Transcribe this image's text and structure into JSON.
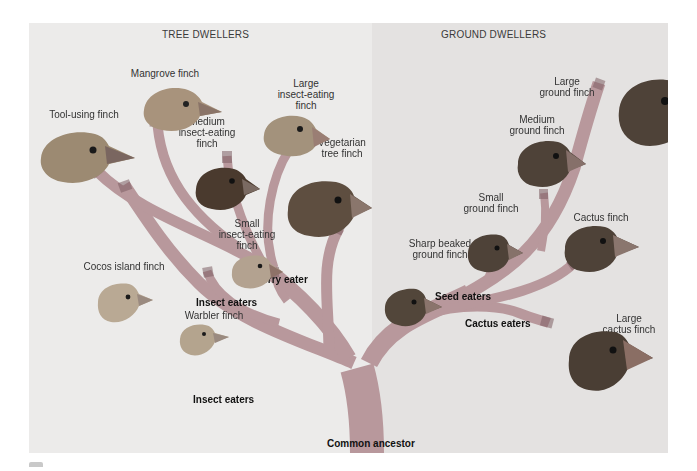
{
  "sections": {
    "left_title": "TREE DWELLERS",
    "right_title": "GROUND DWELLERS"
  },
  "colors": {
    "panel_left": "#ecebea",
    "panel_right": "#e4e2e1",
    "branch": "#b8989c",
    "branch_dark": "#8e6f74",
    "bird_dark": "#5b4a3e",
    "bird_light": "#b8a690",
    "beak": "#c8a89a"
  },
  "species": [
    {
      "id": "mangrove",
      "label": "Mangrove finch"
    },
    {
      "id": "tool_using",
      "label": "Tool-using finch"
    },
    {
      "id": "medium_insect",
      "label": "Medium\ninsect-eating\nfinch"
    },
    {
      "id": "large_insect",
      "label": "Large\ninsect-eating\nfinch"
    },
    {
      "id": "vegetarian",
      "label": "Vegetarian\ntree finch"
    },
    {
      "id": "small_insect",
      "label": "Small\ninsect-eating\nfinch"
    },
    {
      "id": "cocos",
      "label": "Cocos island finch"
    },
    {
      "id": "warbler",
      "label": "Warbler finch"
    },
    {
      "id": "large_ground",
      "label": "Large\nground finch"
    },
    {
      "id": "medium_ground",
      "label": "Medium\nground finch"
    },
    {
      "id": "small_ground",
      "label": "Small\nground finch"
    },
    {
      "id": "sharp_beaked",
      "label": "Sharp beaked\nground finch"
    },
    {
      "id": "cactus",
      "label": "Cactus finch"
    },
    {
      "id": "large_cactus",
      "label": "Large\ncactus finch"
    }
  ],
  "groups": {
    "berry_eater": "Berry eater",
    "insect_eaters_upper": "Insect eaters",
    "insect_eaters_lower": "Insect eaters",
    "seed_eaters": "Seed eaters",
    "cactus_eaters": "Cactus eaters",
    "common_ancestor": "Common ancestor"
  }
}
